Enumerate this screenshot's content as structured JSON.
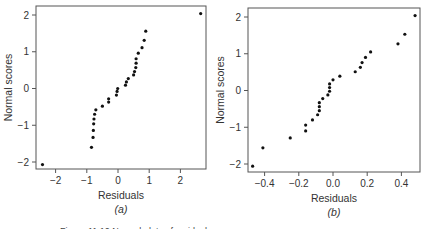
{
  "figure": {
    "caption_partial": "Figure 11.10 Normal plots of residuals"
  },
  "chart_data": [
    {
      "type": "scatter",
      "panel_label": "(a)",
      "title": "",
      "xlabel": "Residuals",
      "ylabel": "Normal scores",
      "xlim": [
        -2.75,
        2.8
      ],
      "ylim": [
        -2.25,
        2.25
      ],
      "xticks": [
        -2,
        -1,
        0,
        1,
        2
      ],
      "yticks": [
        -2,
        -1,
        0,
        1,
        2
      ],
      "xtick_labels": [
        "−2",
        "−1",
        "0",
        "1",
        "2"
      ],
      "ytick_labels": [
        "−2",
        "−1",
        "0",
        "1",
        "2"
      ],
      "grid": false,
      "legend": null,
      "points": [
        [
          -2.42,
          -2.07
        ],
        [
          -0.85,
          -1.6
        ],
        [
          -0.8,
          -1.33
        ],
        [
          -0.79,
          -1.14
        ],
        [
          -0.78,
          -0.96
        ],
        [
          -0.77,
          -0.83
        ],
        [
          -0.75,
          -0.7
        ],
        [
          -0.71,
          -0.58
        ],
        [
          -0.5,
          -0.48
        ],
        [
          -0.3,
          -0.37
        ],
        [
          -0.3,
          -0.28
        ],
        [
          -0.05,
          -0.18
        ],
        [
          -0.03,
          -0.08
        ],
        [
          -0.01,
          0.0
        ],
        [
          0.24,
          0.09
        ],
        [
          0.27,
          0.18
        ],
        [
          0.33,
          0.27
        ],
        [
          0.5,
          0.37
        ],
        [
          0.53,
          0.46
        ],
        [
          0.57,
          0.57
        ],
        [
          0.58,
          0.69
        ],
        [
          0.58,
          0.81
        ],
        [
          0.65,
          0.96
        ],
        [
          0.77,
          1.11
        ],
        [
          0.84,
          1.31
        ],
        [
          0.89,
          1.56
        ],
        [
          2.65,
          2.04
        ]
      ]
    },
    {
      "type": "scatter",
      "panel_label": "(b)",
      "title": "",
      "xlabel": "Residuals",
      "ylabel": "Normal scores",
      "xlim": [
        -0.5,
        0.51
      ],
      "ylim": [
        -2.25,
        2.25
      ],
      "xticks": [
        -0.4,
        -0.2,
        0.0,
        0.2,
        0.4
      ],
      "yticks": [
        -2,
        -1,
        0,
        1,
        2
      ],
      "xtick_labels": [
        "−0.4",
        "−0.2",
        "0.0",
        "0.2",
        "0.4"
      ],
      "ytick_labels": [
        "−2",
        "−1",
        "0",
        "1",
        "2"
      ],
      "grid": false,
      "legend": null,
      "points": [
        [
          -0.47,
          -2.06
        ],
        [
          -0.41,
          -1.56
        ],
        [
          -0.25,
          -1.29
        ],
        [
          -0.16,
          -1.1
        ],
        [
          -0.16,
          -0.94
        ],
        [
          -0.12,
          -0.8
        ],
        [
          -0.09,
          -0.66
        ],
        [
          -0.08,
          -0.55
        ],
        [
          -0.08,
          -0.44
        ],
        [
          -0.08,
          -0.33
        ],
        [
          -0.06,
          -0.22
        ],
        [
          -0.03,
          -0.12
        ],
        [
          -0.02,
          -0.02
        ],
        [
          -0.02,
          0.08
        ],
        [
          -0.02,
          0.18
        ],
        [
          0.0,
          0.29
        ],
        [
          0.04,
          0.39
        ],
        [
          0.13,
          0.51
        ],
        [
          0.16,
          0.63
        ],
        [
          0.17,
          0.76
        ],
        [
          0.19,
          0.9
        ],
        [
          0.22,
          1.05
        ],
        [
          0.38,
          1.27
        ],
        [
          0.42,
          1.53
        ],
        [
          0.48,
          2.04
        ]
      ]
    }
  ],
  "layout": {
    "panels": [
      {
        "frame": {
          "x0": 36,
          "y0": 6,
          "x1": 206,
          "y1": 169
        },
        "x_origin_px": 118,
        "x_px_per_unit": 31.2,
        "y_origin_px": 88.5,
        "y_px_per_unit": 36.75
      },
      {
        "frame": {
          "x0": 248,
          "y0": 8,
          "x1": 420,
          "y1": 172
        },
        "x_origin_px": 333,
        "x_px_per_unit": 171,
        "y_origin_px": 90.5,
        "y_px_per_unit": 36.75
      }
    ],
    "colors": {
      "frame": "#555555",
      "point": "#111111",
      "text": "#333333"
    }
  }
}
